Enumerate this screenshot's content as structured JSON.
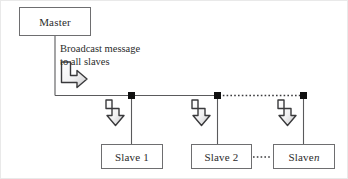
{
  "diagram": {
    "nodes": {
      "master": {
        "label": "Master"
      },
      "slave1": {
        "label": "Slave 1"
      },
      "slave2": {
        "label": "Slave 2"
      },
      "slaven": {
        "label": "Slave ",
        "italic_suffix": "n"
      }
    },
    "annotations": {
      "broadcast": "Broadcast message\nto all slaves"
    },
    "colors": {
      "box_border": "#6e6e70",
      "line": "#5a5a5c",
      "node_marker": "#101010",
      "arrow_outline": "#3a3a3c",
      "arrow_fill_light": "#ffffff",
      "arrow_fill_shadow": "#c9c9cb",
      "text": "#2b2b2b",
      "background": "#ffffff"
    },
    "bus": {
      "y": 94,
      "start_x": 54,
      "end_x": 302,
      "solid_segment": [
        54,
        216
      ],
      "dotted_segment": [
        216,
        302
      ]
    },
    "markers": [
      {
        "name": "node-marker-1",
        "x": 130,
        "y": 94
      },
      {
        "name": "node-marker-2",
        "x": 216,
        "y": 94
      },
      {
        "name": "node-marker-3",
        "x": 302,
        "y": 94
      }
    ],
    "drops": [
      {
        "name": "drop-to-slave-1",
        "x": 130,
        "from_y": 94,
        "to_y": 143
      },
      {
        "name": "drop-to-slave-2",
        "x": 216,
        "from_y": 94,
        "to_y": 143
      },
      {
        "name": "drop-to-slave-n",
        "x": 302,
        "from_y": 94,
        "to_y": 143
      }
    ],
    "slave_link": {
      "name": "dotted-link-slave2-slaven",
      "from_x": 251,
      "to_x": 272,
      "y": 156
    },
    "master_stem": {
      "x": 54,
      "from_y": 35,
      "to_y": 94
    }
  }
}
